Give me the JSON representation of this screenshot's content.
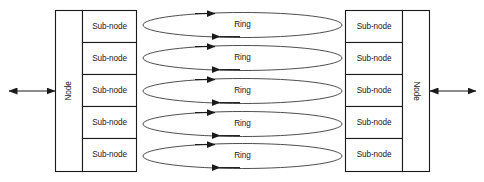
{
  "diagram": {
    "colors": {
      "background": "#ffffff",
      "stroke": "#1a1a1a",
      "ring_stroke": "#3a3a3a",
      "box_fill": "#ffffff"
    },
    "left_node": {
      "label": "Node",
      "orientation": "vertical-up",
      "sub_nodes": [
        {
          "label": "Sub-node"
        },
        {
          "label": "Sub-node"
        },
        {
          "label": "Sub-node"
        },
        {
          "label": "Sub-node"
        },
        {
          "label": "Sub-node"
        }
      ]
    },
    "right_node": {
      "label": "Node",
      "orientation": "vertical-down",
      "sub_nodes": [
        {
          "label": "Sub-node"
        },
        {
          "label": "Sub-node"
        },
        {
          "label": "Sub-node"
        },
        {
          "label": "Sub-node"
        },
        {
          "label": "Sub-node"
        }
      ]
    },
    "rings": [
      {
        "label": "Ring"
      },
      {
        "label": "Ring"
      },
      {
        "label": "Ring"
      },
      {
        "label": "Ring"
      },
      {
        "label": "Ring"
      }
    ],
    "external_links": [
      {
        "name": "left-external-link",
        "style": "double-arrow"
      },
      {
        "name": "right-external-link",
        "style": "double-arrow"
      }
    ]
  }
}
